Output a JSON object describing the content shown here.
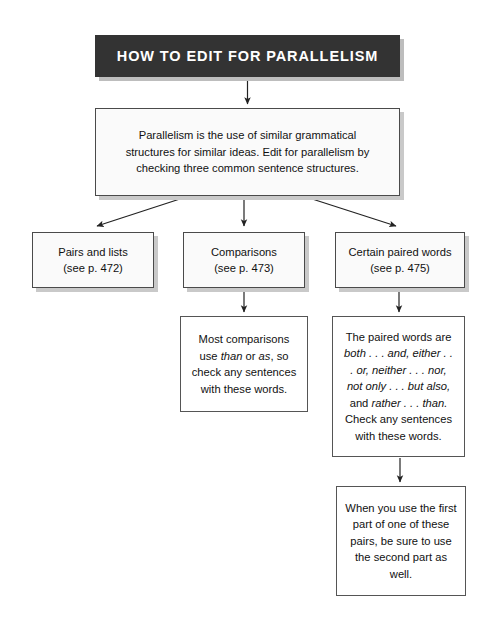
{
  "document": {
    "type": "flowchart",
    "title": "HOW TO EDIT FOR PARALLELISM"
  },
  "banner": {
    "label": "HOW TO EDIT FOR PARALLELISM",
    "background_color": "#333333",
    "text_color": "#ffffff",
    "shadow_color": "#bdbdbd"
  },
  "nodes": {
    "definition": {
      "line1": "Parallelism is the use of similar grammatical",
      "line2": "structures for similar ideas. Edit for parallelism by",
      "line3": "checking three common sentence structures."
    },
    "pairs": {
      "line1": "Pairs and lists",
      "line2": "(see p. 472)"
    },
    "comparisons": {
      "line1": "Comparisons",
      "line2": "(see p. 473)"
    },
    "paired_words": {
      "line1": "Certain paired words",
      "line2": "(see p. 475)"
    },
    "comparisons_detail": {
      "seg1": "Most comparisons use ",
      "italic1": "than",
      "seg2": " or ",
      "italic2": "as",
      "seg3": ", so check any sentences with these words."
    },
    "paired_words_detail": {
      "seg1": "The paired words are ",
      "italic1": "both . . . and, either . . . or, neither . . . nor, not only . . . but also,",
      "seg2": " and ",
      "italic2": "rather . . . than.",
      "seg3": " Check any sentences with these words."
    },
    "paired_words_note": {
      "text": "When you use the first part of one of these pairs, be sure to use the second part as well."
    }
  },
  "style": {
    "box_fill": "#fafafa",
    "box_border": "#4a4a4a",
    "box_shadow": "#c9c9c9",
    "connector_color": "#222222",
    "page_background": "#ffffff"
  },
  "connectors": [
    {
      "name": "banner-to-definition",
      "from": "banner",
      "to": "definition"
    },
    {
      "name": "definition-to-pairs",
      "from": "definition",
      "to": "pairs"
    },
    {
      "name": "definition-to-comparisons",
      "from": "definition",
      "to": "comparisons"
    },
    {
      "name": "definition-to-paired-words",
      "from": "definition",
      "to": "paired_words"
    },
    {
      "name": "comparisons-to-detail",
      "from": "comparisons",
      "to": "comparisons_detail"
    },
    {
      "name": "paired-words-to-detail",
      "from": "paired_words",
      "to": "paired_words_detail"
    },
    {
      "name": "paired-words-detail-to-note",
      "from": "paired_words_detail",
      "to": "paired_words_note"
    }
  ]
}
